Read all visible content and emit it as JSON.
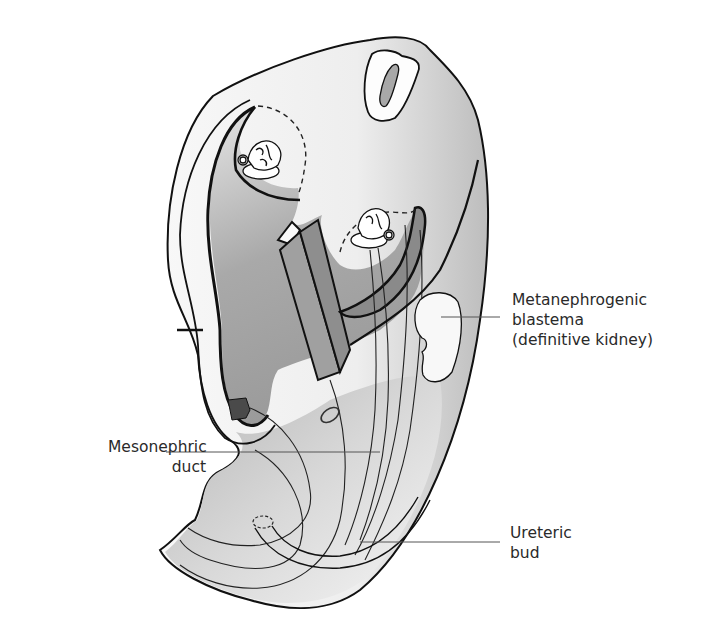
{
  "figure": {
    "type": "embryo-cross-section-illustration",
    "colors": {
      "outline": "#111111",
      "shade_dark": "#8c8c8c",
      "shade_mid": "#b8b8b8",
      "shade_light": "#e2e2e2",
      "leader_line": "#555555",
      "label_text": "#2a2a2a"
    }
  },
  "labels": {
    "metanephrogenic": {
      "line1": "Metanephrogenic",
      "line2": "blastema",
      "line3": "(definitive kidney)"
    },
    "mesonephric": {
      "line1": "Mesonephric",
      "line2": "duct"
    },
    "ureteric": {
      "line1": "Ureteric",
      "line2": "bud"
    }
  }
}
